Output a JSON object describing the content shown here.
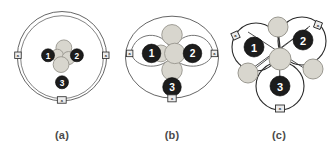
{
  "figure": {
    "kind": "schematic-diagram",
    "panel_count": 3,
    "colors": {
      "node_fill": "#1c1c1c",
      "node_stroke": "#000000",
      "node_text": "#ffffff",
      "ring_stroke": "#555555",
      "orbit_stroke": "#2b2b2b",
      "light_circle_fill": "#d8d6ce",
      "light_circle_stroke": "#9a9890",
      "marker_fill": "#e8e8e8",
      "marker_stroke": "#2e2e2e",
      "caption_color": "#4a4a4a",
      "background": "#ffffff"
    }
  },
  "panels": [
    {
      "id": "a",
      "caption": "(a)",
      "description": "Single large double ring enclosing three dark numbered nodes and a central cluster of four light circles",
      "rings": 2,
      "nodes": [
        {
          "label": "1",
          "cx": 43,
          "cy": 55
        },
        {
          "label": "2",
          "cx": 73,
          "cy": 55
        },
        {
          "label": "3",
          "cx": 58,
          "cy": 83
        }
      ],
      "light_circles": [
        {
          "cx": 60,
          "cy": 47
        },
        {
          "cx": 53,
          "cy": 55
        },
        {
          "cx": 64,
          "cy": 58
        },
        {
          "cx": 57,
          "cy": 64
        }
      ],
      "markers": [
        {
          "label": "a",
          "x": 11,
          "y": 55
        },
        {
          "label": "a",
          "x": 105,
          "y": 55
        },
        {
          "label": "a",
          "x": 58,
          "y": 104
        }
      ]
    },
    {
      "id": "b",
      "caption": "(b)",
      "description": "Outer ellipse with two inner lobes, three dark numbered nodes and a plus-shaped cluster of five light circles",
      "rings": 1,
      "lobes": 2,
      "nodes": [
        {
          "label": "1",
          "cx": 38,
          "cy": 53
        },
        {
          "label": "2",
          "cx": 78,
          "cy": 53
        },
        {
          "label": "3",
          "cx": 58,
          "cy": 87
        }
      ],
      "light_circles": [
        {
          "cx": 58,
          "cy": 34
        },
        {
          "cx": 58,
          "cy": 53
        },
        {
          "cx": 58,
          "cy": 70
        },
        {
          "cx": 46,
          "cy": 53
        },
        {
          "cx": 70,
          "cy": 53
        }
      ],
      "markers": [
        {
          "label": "a",
          "x": 13,
          "y": 53
        },
        {
          "label": "a",
          "x": 103,
          "y": 53
        },
        {
          "label": "a",
          "x": 58,
          "y": 106
        }
      ]
    },
    {
      "id": "c",
      "caption": "(c)",
      "description": "Three separate orbit circles in triangular arrangement, each holding one dark numbered node, linked by crossing chords with light circles between them",
      "rings": 3,
      "nodes": [
        {
          "label": "1",
          "cx": 30,
          "cy": 48
        },
        {
          "label": "2",
          "cx": 76,
          "cy": 42
        },
        {
          "label": "3",
          "cx": 54,
          "cy": 86
        }
      ],
      "light_circles": [
        {
          "cx": 53,
          "cy": 28
        },
        {
          "cx": 54,
          "cy": 60
        },
        {
          "cx": 24,
          "cy": 74
        },
        {
          "cx": 84,
          "cy": 70
        }
      ],
      "markers": [
        {
          "label": "a",
          "x": 9,
          "y": 35
        },
        {
          "label": "a",
          "x": 92,
          "y": 25
        },
        {
          "label": "a",
          "x": 54,
          "y": 108
        }
      ]
    }
  ]
}
